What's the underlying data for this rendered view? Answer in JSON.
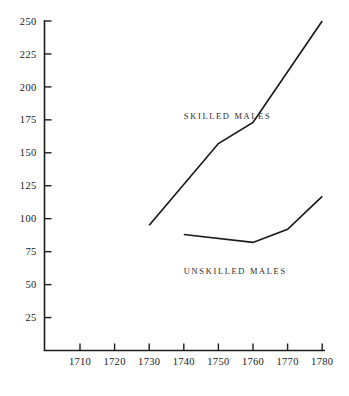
{
  "chart_data": {
    "type": "line",
    "title": "",
    "subtitle": "",
    "xlabel": "",
    "ylabel": "",
    "x": [
      1710,
      1720,
      1730,
      1740,
      1750,
      1760,
      1770,
      1780
    ],
    "xticklabels": [
      "1710",
      "1720",
      "1730",
      "1740",
      "1750",
      "1760",
      "1770",
      "1780"
    ],
    "yticks": [
      25,
      50,
      75,
      100,
      125,
      150,
      175,
      200,
      225,
      250
    ],
    "yticklabels": [
      "25",
      "50",
      "75",
      "100",
      "125",
      "150",
      "175",
      "200",
      "225",
      "250"
    ],
    "xlim": [
      1705,
      1782
    ],
    "ylim": [
      0,
      250
    ],
    "grid": false,
    "legend_position": "inline-annotation",
    "series": [
      {
        "name": "SKILLED MALES",
        "x": [
          1730,
          1750,
          1760,
          1780
        ],
        "values": [
          95,
          157,
          173,
          250
        ],
        "color": "#1a1a1a",
        "label_x": 1740,
        "label_y": 176
      },
      {
        "name": "UNSKILLED MALES",
        "x": [
          1740,
          1760,
          1770,
          1780
        ],
        "values": [
          88,
          82,
          92,
          117
        ],
        "color": "#1a1a1a",
        "label_x": 1740,
        "label_y": 58
      }
    ],
    "annotations": [
      {
        "text": "SKILLED MALES",
        "x": 1740,
        "y": 176
      },
      {
        "text": "UNSKILLED MALES",
        "x": 1740,
        "y": 58
      }
    ]
  },
  "colors": {
    "axis": "#1c1c1c",
    "line": "#1a1a1a",
    "background": "#ffffff",
    "text": "#1a1a1a"
  }
}
